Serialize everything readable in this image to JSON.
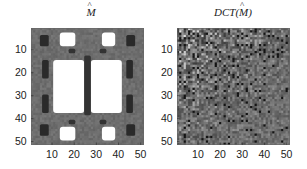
{
  "chart_data": [
    {
      "type": "heatmap",
      "title": "M̂",
      "title_parts": {
        "base": "M",
        "accent": "^"
      },
      "xlabel": "",
      "ylabel": "",
      "xticks": [
        10,
        20,
        30,
        40,
        50
      ],
      "yticks": [
        10,
        20,
        30,
        40,
        50
      ],
      "xlim": [
        0.5,
        51.5
      ],
      "ylim": [
        51.5,
        0.5
      ],
      "colormap": "gray",
      "background_value_color": "#7a7a7a",
      "description": "Symmetric mask-like matrix: two large white rounded rectangles in the center, small white blocks near the four corners, dark elongated streaks along left/right sides and the center column.",
      "regions": [
        {
          "kind": "white",
          "x0": 11,
          "x1": 24,
          "y0": 15,
          "y1": 37,
          "color": "#ffffff"
        },
        {
          "kind": "white",
          "x0": 28,
          "x1": 41,
          "y0": 15,
          "y1": 37,
          "color": "#ffffff"
        },
        {
          "kind": "white",
          "x0": 14,
          "x1": 20,
          "y0": 3,
          "y1": 8,
          "color": "#ffffff"
        },
        {
          "kind": "white",
          "x0": 33,
          "x1": 38,
          "y0": 3,
          "y1": 8,
          "color": "#ffffff"
        },
        {
          "kind": "white",
          "x0": 14,
          "x1": 20,
          "y0": 44,
          "y1": 49,
          "color": "#ffffff"
        },
        {
          "kind": "white",
          "x0": 33,
          "x1": 38,
          "y0": 44,
          "y1": 49,
          "color": "#ffffff"
        },
        {
          "kind": "dark",
          "x0": 5,
          "x1": 8,
          "y0": 4,
          "y1": 8,
          "color": "#2a2a2a"
        },
        {
          "kind": "dark",
          "x0": 44,
          "x1": 47,
          "y0": 4,
          "y1": 8,
          "color": "#2a2a2a"
        },
        {
          "kind": "dark",
          "x0": 5,
          "x1": 8,
          "y0": 43,
          "y1": 47,
          "color": "#2a2a2a"
        },
        {
          "kind": "dark",
          "x0": 44,
          "x1": 47,
          "y0": 43,
          "y1": 47,
          "color": "#2a2a2a"
        },
        {
          "kind": "dark",
          "x0": 6,
          "x1": 8,
          "y0": 15,
          "y1": 22,
          "color": "#2a2a2a"
        },
        {
          "kind": "dark",
          "x0": 6,
          "x1": 8,
          "y0": 30,
          "y1": 37,
          "color": "#2a2a2a"
        },
        {
          "kind": "dark",
          "x0": 44,
          "x1": 46,
          "y0": 15,
          "y1": 22,
          "color": "#2a2a2a"
        },
        {
          "kind": "dark",
          "x0": 44,
          "x1": 46,
          "y0": 30,
          "y1": 37,
          "color": "#2a2a2a"
        },
        {
          "kind": "dark",
          "x0": 25,
          "x1": 27,
          "y0": 13,
          "y1": 38,
          "color": "#333333"
        },
        {
          "kind": "dark",
          "x0": 18,
          "x1": 20,
          "y0": 10,
          "y1": 11,
          "color": "#333333"
        },
        {
          "kind": "dark",
          "x0": 32,
          "x1": 34,
          "y0": 10,
          "y1": 11,
          "color": "#333333"
        },
        {
          "kind": "dark",
          "x0": 18,
          "x1": 20,
          "y0": 41,
          "y1": 42,
          "color": "#333333"
        },
        {
          "kind": "dark",
          "x0": 32,
          "x1": 34,
          "y0": 41,
          "y1": 42,
          "color": "#333333"
        }
      ]
    },
    {
      "type": "heatmap",
      "title": "DCT(M̂)",
      "title_parts": {
        "prefix": "DCT(",
        "base": "M",
        "accent": "^",
        "suffix": ")"
      },
      "xlabel": "",
      "ylabel": "",
      "xticks": [
        10,
        20,
        30,
        40,
        50
      ],
      "yticks": [
        10,
        20,
        30,
        40,
        50
      ],
      "xlim": [
        0.5,
        51.5
      ],
      "ylim": [
        51.5,
        0.5
      ],
      "colormap": "gray",
      "background_value_color": "#6e6e6e",
      "description": "Noisy DCT coefficient map; brighter/higher-contrast coefficients concentrated in the upper-left (low frequencies) region, decaying toward lower-right.",
      "grid_size": 51,
      "seed": 7
    }
  ]
}
